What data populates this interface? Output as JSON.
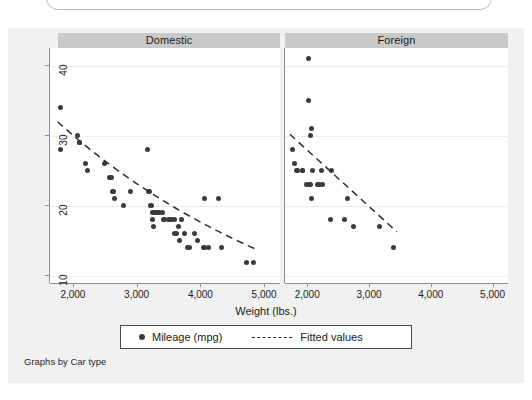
{
  "window": {
    "frame_name": "rounded-window-top"
  },
  "graph": {
    "panels": [
      {
        "id": "domestic",
        "label": "Domestic"
      },
      {
        "id": "foreign",
        "label": "Foreign"
      }
    ],
    "y_axis": {
      "ticks": [
        10,
        20,
        30,
        40
      ],
      "tick_labels": [
        "10",
        "20",
        "30",
        "40"
      ],
      "range": [
        9,
        42.5
      ],
      "title": ""
    },
    "x_axis": {
      "ticks": [
        2000,
        3000,
        4000,
        5000
      ],
      "tick_labels": [
        "2,000",
        "3,000",
        "4,000",
        "5,000"
      ],
      "range": [
        1640,
        5250
      ],
      "title": "Weight (lbs.)"
    },
    "legend": {
      "items": [
        {
          "label": "Mileage (mpg)",
          "marker": "dot-marker",
          "color": "#3b3b3b"
        },
        {
          "label": "Fitted values",
          "marker": "dashed-line",
          "color": "#2e2e2e"
        }
      ]
    },
    "note": "Graphs by Car type",
    "colors": {
      "region_bg": "#f1f1f1",
      "plot_bg": "#ffffff",
      "panel_header_bg": "#c9c9c9",
      "marker": "#3b3b3b",
      "fit_line": "#2e2e2e",
      "gridline": "#ededed",
      "axis": "#8f8f8f"
    }
  },
  "chart_data": {
    "type": "scatter",
    "title": "",
    "xlabel": "Weight (lbs.)",
    "ylabel": "Mileage (mpg)",
    "xlim": [
      1640,
      5250
    ],
    "ylim": [
      9,
      42.5
    ],
    "grid": true,
    "legend_position": "bottom",
    "facet_by": "Car type",
    "panels": [
      {
        "name": "Domestic",
        "series": [
          {
            "name": "Mileage (mpg)",
            "type": "scatter",
            "points": [
              [
                1800,
                34
              ],
              [
                1800,
                28
              ],
              [
                2070,
                30
              ],
              [
                2100,
                29
              ],
              [
                2110,
                29
              ],
              [
                2200,
                26
              ],
              [
                2230,
                25
              ],
              [
                2500,
                26
              ],
              [
                2580,
                24
              ],
              [
                2600,
                24
              ],
              [
                2620,
                22
              ],
              [
                2640,
                22
              ],
              [
                2650,
                21
              ],
              [
                2800,
                20
              ],
              [
                2900,
                22
              ],
              [
                3170,
                28
              ],
              [
                3180,
                22
              ],
              [
                3200,
                22
              ],
              [
                3220,
                20
              ],
              [
                3230,
                20
              ],
              [
                3250,
                19
              ],
              [
                3280,
                19
              ],
              [
                3300,
                19
              ],
              [
                3310,
                19
              ],
              [
                3350,
                19
              ],
              [
                3360,
                19
              ],
              [
                3400,
                19
              ],
              [
                3420,
                18
              ],
              [
                3430,
                18
              ],
              [
                3250,
                18
              ],
              [
                3260,
                17
              ],
              [
                3500,
                18
              ],
              [
                3520,
                18
              ],
              [
                3550,
                18
              ],
              [
                3600,
                18
              ],
              [
                3600,
                16
              ],
              [
                3620,
                16
              ],
              [
                3650,
                17
              ],
              [
                3670,
                15
              ],
              [
                3700,
                18
              ],
              [
                3750,
                16
              ],
              [
                3800,
                14
              ],
              [
                3830,
                14
              ],
              [
                3900,
                16
              ],
              [
                3950,
                15
              ],
              [
                4050,
                14
              ],
              [
                4060,
                14
              ],
              [
                4060,
                21
              ],
              [
                4130,
                14
              ],
              [
                4290,
                21
              ],
              [
                4330,
                14
              ],
              [
                4720,
                12
              ],
              [
                4840,
                12
              ]
            ]
          },
          {
            "name": "Fitted values",
            "type": "line",
            "style": "dashed",
            "points": [
              [
                1760,
                32.0
              ],
              [
                4900,
                13.7
              ]
            ],
            "curved": true,
            "control": [
              [
                1760,
                32.0
              ],
              [
                3100,
                20.5
              ],
              [
                4900,
                13.7
              ]
            ]
          }
        ]
      },
      {
        "name": "Foreign",
        "series": [
          {
            "name": "Mileage (mpg)",
            "type": "scatter",
            "points": [
              [
                2020,
                41
              ],
              [
                2020,
                35
              ],
              [
                2050,
                30
              ],
              [
                2070,
                31
              ],
              [
                1760,
                28
              ],
              [
                1800,
                26
              ],
              [
                1830,
                25
              ],
              [
                1840,
                25
              ],
              [
                1930,
                25
              ],
              [
                1930,
                25
              ],
              [
                2080,
                25
              ],
              [
                2230,
                25
              ],
              [
                2400,
                25
              ],
              [
                1990,
                23
              ],
              [
                2040,
                23
              ],
              [
                2050,
                23
              ],
              [
                2160,
                23
              ],
              [
                2200,
                23
              ],
              [
                2240,
                23
              ],
              [
                2070,
                21
              ],
              [
                2650,
                21
              ],
              [
                2370,
                18
              ],
              [
                2600,
                18
              ],
              [
                2750,
                17
              ],
              [
                3170,
                17
              ],
              [
                3400,
                14
              ]
            ]
          },
          {
            "name": "Fitted values",
            "type": "line",
            "style": "dashed",
            "points": [
              [
                1720,
                30.2
              ],
              [
                3450,
                16.3
              ]
            ],
            "curved": false
          }
        ]
      }
    ]
  }
}
